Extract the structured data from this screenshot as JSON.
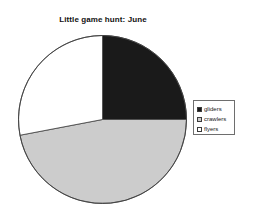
{
  "chart_data": {
    "type": "pie",
    "title": "Little game hunt: June",
    "categories": [
      "gliders",
      "crawlers",
      "flyers"
    ],
    "values": [
      25,
      47,
      28
    ],
    "units": "percent",
    "slice_colors": [
      "#1a1a1a",
      "#cccccc",
      "#ffffff"
    ],
    "slice_start_angles_deg": [
      0,
      90,
      188
    ],
    "slice_sweep_angles_deg": [
      90,
      98,
      172
    ],
    "legend_position": "right",
    "grid": false,
    "xlabel": "",
    "ylabel": "",
    "outline_color": "#404040"
  },
  "legend": {
    "entries": [
      {
        "label": "gliders",
        "swatch_color": "#1a1a1a"
      },
      {
        "label": "crawlers",
        "swatch_color": "#cccccc"
      },
      {
        "label": "flyers",
        "swatch_color": "#ffffff"
      }
    ]
  }
}
